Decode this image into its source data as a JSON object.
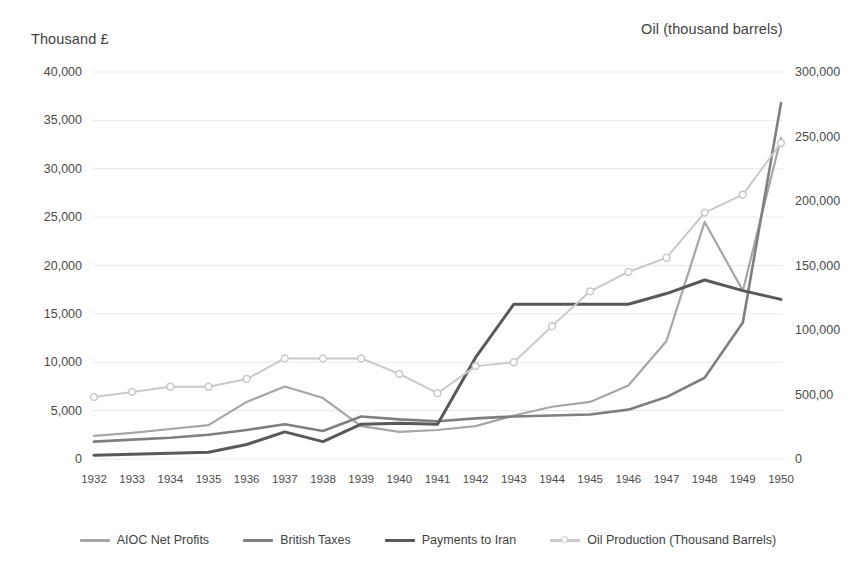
{
  "chart_data": {
    "type": "line",
    "title": "",
    "xlabel": "",
    "ylabel": "Thousand £",
    "y2label": "Oil (thousand barrels)",
    "grid": true,
    "legend_position": "bottom",
    "x": [
      1932,
      1933,
      1934,
      1935,
      1936,
      1937,
      1938,
      1939,
      1940,
      1941,
      1942,
      1943,
      1944,
      1945,
      1946,
      1947,
      1948,
      1949,
      1950
    ],
    "categories": [
      "1932",
      "1933",
      "1934",
      "1935",
      "1936",
      "1937",
      "1938",
      "1939",
      "1940",
      "1941",
      "1942",
      "1943",
      "1944",
      "1945",
      "1946",
      "1947",
      "1948",
      "1949",
      "1950"
    ],
    "ylim": [
      0,
      40000
    ],
    "y2lim": [
      0,
      300000
    ],
    "yticks": [
      0,
      5000,
      10000,
      15000,
      20000,
      25000,
      30000,
      35000,
      40000
    ],
    "ytick_labels": [
      "0",
      "5,000",
      "10,000",
      "15,000",
      "20,000",
      "25,000",
      "30,000",
      "35,000",
      "40,000"
    ],
    "y2ticks": [
      0,
      50000,
      100000,
      150000,
      200000,
      250000,
      300000
    ],
    "y2tick_labels": [
      "0",
      "500,00",
      "100,000",
      "150,000",
      "200,000",
      "250,000",
      "300,000"
    ],
    "series": [
      {
        "name": "AIOC Net Profits",
        "axis": "left",
        "color": "#a6a6a6",
        "width": 2.2,
        "markers": false,
        "values": [
          2400,
          2700,
          3100,
          3500,
          5900,
          7500,
          6300,
          3400,
          2800,
          3000,
          3400,
          4500,
          5400,
          5900,
          7600,
          12200,
          24500,
          17400,
          33200
        ]
      },
      {
        "name": "British Taxes",
        "axis": "left",
        "color": "#7f7f7f",
        "width": 2.6,
        "markers": false,
        "values": [
          1800,
          2000,
          2200,
          2500,
          3000,
          3600,
          2900,
          4400,
          4100,
          3900,
          4200,
          4400,
          4500,
          4600,
          5100,
          6400,
          8400,
          14100,
          36800
        ]
      },
      {
        "name": "Payments to Iran",
        "axis": "left",
        "color": "#595959",
        "width": 3.0,
        "markers": false,
        "values": [
          400,
          500,
          600,
          700,
          1500,
          2800,
          1800,
          3600,
          3700,
          3600,
          10500,
          16000,
          16000,
          16000,
          16000,
          17100,
          18500,
          17400,
          16500
        ]
      },
      {
        "name": "Oil Production (Thousand Barrels)",
        "axis": "right",
        "color": "#c9c9c9",
        "width": 2.0,
        "markers": true,
        "values": [
          48000,
          52000,
          56000,
          56000,
          62000,
          78000,
          78000,
          78000,
          66000,
          51000,
          72000,
          75000,
          103000,
          130000,
          145000,
          156000,
          191000,
          205000,
          245000
        ]
      }
    ]
  },
  "legend": {
    "items": [
      {
        "label": "AIOC Net Profits",
        "color": "#a6a6a6",
        "markers": false
      },
      {
        "label": "British Taxes",
        "color": "#7f7f7f",
        "markers": false
      },
      {
        "label": "Payments to Iran",
        "color": "#595959",
        "markers": false
      },
      {
        "label": "Oil Production (Thousand Barrels)",
        "color": "#c9c9c9",
        "markers": true
      }
    ]
  },
  "axes": {
    "left_title": "Thousand £",
    "right_title": "Oil (thousand barrels)"
  },
  "colors": {
    "background": "#ffffff",
    "gridline": "#eaeaea",
    "text": "#3f3f3f"
  }
}
